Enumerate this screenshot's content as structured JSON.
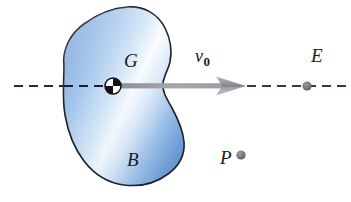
{
  "figure": {
    "background_color": "#ffffff",
    "labels": {
      "body": "B",
      "center_of_gravity": "G",
      "velocity": "v",
      "velocity_subscript": "0",
      "point_e": "E",
      "point_p": "P"
    },
    "colors": {
      "body_fill_edge": "#6f9dd6",
      "body_fill_mid": "#a9c9ec",
      "body_fill_highlight": "#fbfdff",
      "body_outline": "#1b1b24",
      "axis_dash": "#2a2a3c",
      "arrow_gray": "#9b9b9b",
      "arrow_gray_dark": "#6e6e78",
      "point_dot": "#6d6d75",
      "label_text": "#1a1a1a"
    },
    "geometry": {
      "axis_y": 86,
      "axis_start_x": 14,
      "axis_end_x": 349,
      "arrow_tail_x": 118,
      "arrow_tip_x": 246,
      "cg_marker": {
        "cx": 113,
        "cy": 86,
        "r": 8
      },
      "point_e_dot": {
        "cx": 307,
        "cy": 86,
        "r": 4.6
      },
      "point_p_dot": {
        "cx": 241,
        "cy": 155,
        "r": 4.6
      }
    }
  }
}
